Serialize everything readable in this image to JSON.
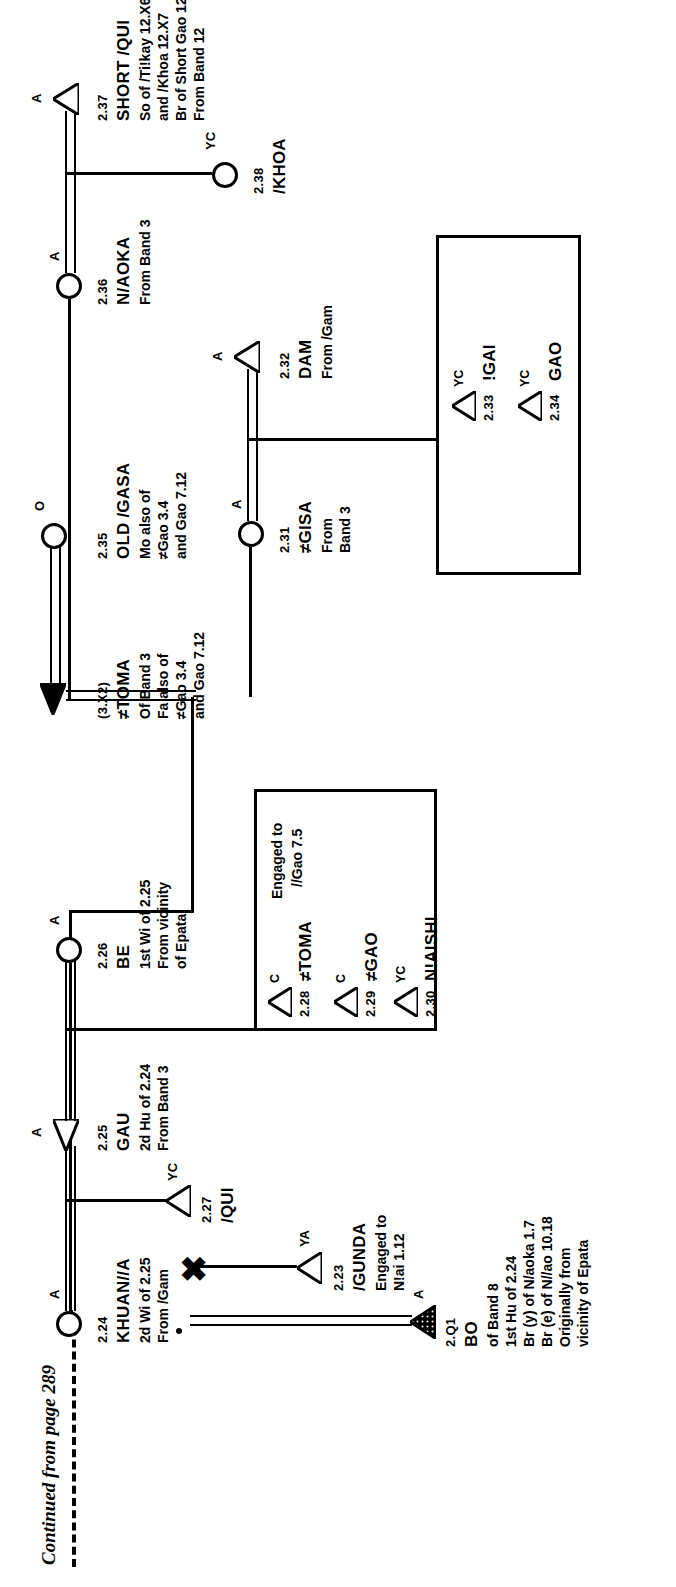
{
  "diagram": {
    "type": "kinship-genealogy-chart",
    "orientation": "rotated-90-ccw",
    "continuation_note": "Continued from page 289",
    "symbols": {
      "male": "triangle",
      "female": "circle",
      "deceased_or_filled": "filled-triangle",
      "marriage_dissolved": "x-mark",
      "age_marker_A": "A",
      "age_marker_YC": "YC",
      "age_marker_YA": "YA",
      "age_marker_C": "C",
      "age_marker_O": "O"
    },
    "persons": [
      {
        "id": "2.Q1",
        "num": "2.Q1",
        "name": "BO",
        "sex": "male",
        "symbol": "triangle-hatched",
        "marker": "A",
        "details": [
          "of Band 8",
          "1st Hu of 2.24",
          "Br (y) of N/aoka 1.7",
          "Br (e) of N//ao 10.18",
          "Originally from",
          "vicinity of Epata"
        ]
      },
      {
        "id": "2.23",
        "num": "2.23",
        "name": "/GUNDA",
        "sex": "male",
        "symbol": "triangle-open",
        "marker": "YA",
        "details": [
          "Engaged to",
          "N!ai 1.12"
        ]
      },
      {
        "id": "2.24",
        "num": "2.24",
        "name": "KHUAN//A",
        "sex": "female",
        "symbol": "circle",
        "marker": "A",
        "details": [
          "2d Wi of 2.25",
          "From /Gam"
        ]
      },
      {
        "id": "2.25",
        "num": "2.25",
        "name": "GAU",
        "sex": "male",
        "symbol": "triangle-open",
        "marker": "A",
        "details": [
          "2d Hu of 2.24",
          "From Band 3"
        ]
      },
      {
        "id": "2.26",
        "num": "2.26",
        "name": "BE",
        "sex": "female",
        "symbol": "circle",
        "marker": "A",
        "details": [
          "1st Wi of 2.25",
          "From vicinity",
          "of Epata"
        ]
      },
      {
        "id": "2.27",
        "num": "2.27",
        "name": "/QUI",
        "sex": "male",
        "symbol": "triangle-open",
        "marker": "YC",
        "details": []
      },
      {
        "id": "2.28",
        "num": "2.28",
        "name": "≠TOMA",
        "sex": "male",
        "symbol": "triangle-open",
        "marker": "C",
        "details": [
          "Engaged to",
          "//Gao 7.5"
        ]
      },
      {
        "id": "2.29",
        "num": "2.29",
        "name": "≠GAO",
        "sex": "male",
        "symbol": "triangle-open",
        "marker": "C",
        "details": []
      },
      {
        "id": "2.30",
        "num": "2.30",
        "name": "N!AISHI",
        "sex": "male",
        "symbol": "triangle-open",
        "marker": "YC",
        "details": []
      },
      {
        "id": "2.31",
        "num": "2.31",
        "name": "≠GISA",
        "sex": "female",
        "symbol": "circle",
        "marker": "A",
        "details": [
          "From",
          "Band 3"
        ]
      },
      {
        "id": "2.32",
        "num": "2.32",
        "name": "DAM",
        "sex": "male",
        "symbol": "triangle-open",
        "marker": "A",
        "details": [
          "From /Gam"
        ]
      },
      {
        "id": "2.33",
        "num": "2.33",
        "name": "!GAI",
        "sex": "male",
        "symbol": "triangle-open",
        "marker": "YC",
        "details": []
      },
      {
        "id": "2.34",
        "num": "2.34",
        "name": "GAO",
        "sex": "male",
        "symbol": "triangle-open",
        "marker": "YC",
        "details": []
      },
      {
        "id": "2.35",
        "num": "2.35",
        "name": "OLD /GASA",
        "sex": "female",
        "symbol": "circle",
        "marker": "O",
        "details": [
          "Mo also of",
          "≠Gao 3.4",
          "and Gao 7.12"
        ]
      },
      {
        "id": "3.X2",
        "num": "(3.X2)",
        "name": "≠TOMA",
        "sex": "male",
        "symbol": "triangle-filled",
        "marker": "",
        "details": [
          "Of Band 3",
          "Fa also of",
          "≠Gao 3.4",
          "and Gao 7.12"
        ]
      },
      {
        "id": "2.36",
        "num": "2.36",
        "name": "N/AOKA",
        "sex": "female",
        "symbol": "circle",
        "marker": "A",
        "details": [
          "From Band 3"
        ]
      },
      {
        "id": "2.37",
        "num": "2.37",
        "name": "SHORT /QUI",
        "sex": "male",
        "symbol": "triangle-open",
        "marker": "A",
        "details": [
          "So of /Ti!kay 12.X6",
          "and /Khoa 12.X7",
          "Br of Short Gao 12.6",
          "From Band 12"
        ]
      },
      {
        "id": "2.38",
        "num": "2.38",
        "name": "/KHOA",
        "sex": "female",
        "symbol": "circle",
        "marker": "YC",
        "details": []
      }
    ]
  }
}
